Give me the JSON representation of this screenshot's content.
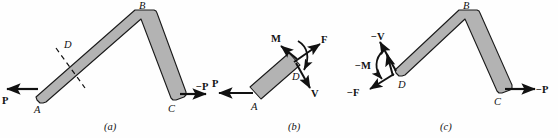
{
  "figure": {
    "background_color": "#fefefe",
    "bar_fill_color": "#b3b3b3",
    "bar_stroke_color": "#1a1a1a",
    "arrow_color": "#111111",
    "text_color": "#111111"
  },
  "panels": [
    {
      "id": "a",
      "caption": "(a)",
      "point_labels": [
        {
          "key": "A",
          "text": "A"
        },
        {
          "key": "B",
          "text": "B"
        },
        {
          "key": "C",
          "text": "C"
        },
        {
          "key": "D",
          "text": "D"
        }
      ],
      "vectors": [
        {
          "key": "P_left",
          "text": "P",
          "direction": "left",
          "at": "A"
        },
        {
          "key": "P_right",
          "text": "−P",
          "direction": "right",
          "at": "C"
        }
      ],
      "section_cut": {
        "key": "cut-D",
        "style": "dashed",
        "at": "D"
      }
    },
    {
      "id": "b",
      "caption": "(b)",
      "point_labels": [
        {
          "key": "A",
          "text": "A"
        },
        {
          "key": "D",
          "text": "D"
        }
      ],
      "vectors": [
        {
          "key": "P",
          "text": "P",
          "direction": "left",
          "at": "A"
        },
        {
          "key": "M",
          "text": "M",
          "direction": "up-left",
          "at": "D"
        },
        {
          "key": "F",
          "text": "F",
          "direction": "up-right",
          "at": "D"
        },
        {
          "key": "V",
          "text": "V",
          "direction": "down-right",
          "at": "D"
        }
      ],
      "moment_arc": {
        "key": "moment-arc-b",
        "sense": "clockwise"
      }
    },
    {
      "id": "c",
      "caption": "(c)",
      "point_labels": [
        {
          "key": "B",
          "text": "B"
        },
        {
          "key": "C",
          "text": "C"
        },
        {
          "key": "D",
          "text": "D"
        }
      ],
      "vectors": [
        {
          "key": "V_neg",
          "text": "−V",
          "direction": "up-left",
          "at": "D"
        },
        {
          "key": "M_neg",
          "text": "−M",
          "direction": "up",
          "at": "D"
        },
        {
          "key": "F_neg",
          "text": "−F",
          "direction": "down-left",
          "at": "D"
        },
        {
          "key": "P_neg",
          "text": "−P",
          "direction": "right",
          "at": "C"
        }
      ],
      "moment_arc": {
        "key": "moment-arc-c",
        "sense": "counterclockwise"
      }
    }
  ]
}
